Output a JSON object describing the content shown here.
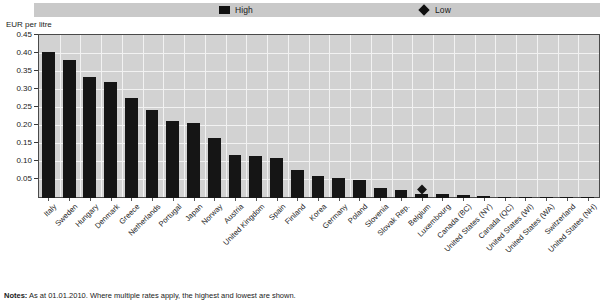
{
  "legend": {
    "high_label": "High",
    "low_label": "Low",
    "high_icon": "filled-square-marker",
    "low_icon": "filled-diamond-marker",
    "background_color": "#c9c9c9"
  },
  "axis_title": "EUR per litre",
  "notes": {
    "prefix": "Notes:",
    "text": " As at 01.01.2010. Where multiple rates apply, the highest and lowest are shown."
  },
  "style": {
    "bar_color": "#151515",
    "plot_background": "#d2d2d2",
    "gridline_color": "#f2f2f2",
    "frame_color": "#4a4a4a"
  },
  "chart_data": {
    "type": "bar",
    "title": "",
    "xlabel": "",
    "ylabel": "EUR per litre",
    "ylim": [
      0,
      0.45
    ],
    "ytick_labels": [
      "0.45",
      "0.40",
      "0.35",
      "0.30",
      "0.25",
      "0.20",
      "0.15",
      "0.10",
      "0.05"
    ],
    "ytick_values": [
      0.45,
      0.4,
      0.35,
      0.3,
      0.25,
      0.2,
      0.15,
      0.1,
      0.05
    ],
    "grid": true,
    "legend_position": "top",
    "categories": [
      "Italy",
      "Sweden",
      "Hungary",
      "Denmark",
      "Greece",
      "Netherlands",
      "Portugal",
      "Japan",
      "Norway",
      "Austria",
      "United Kingdom",
      "Spain",
      "Finland",
      "Korea",
      "Germany",
      "Poland",
      "Slovenia",
      "Slovak Rep.",
      "Belgium",
      "Luxembourg",
      "Canada (BC)",
      "United States (NY)",
      "Canada (QC)",
      "United States (WI)",
      "United States (WA)",
      "Switzerland",
      "United States (NH)"
    ],
    "series": [
      {
        "name": "High",
        "values": [
          0.405,
          0.382,
          0.337,
          0.322,
          0.277,
          0.245,
          0.213,
          0.208,
          0.168,
          0.12,
          0.118,
          0.11,
          0.078,
          0.06,
          0.055,
          0.05,
          0.027,
          0.022,
          0.012,
          0.01,
          0.008,
          0.005,
          0.004,
          0.003,
          0.003,
          0.002,
          0.002
        ]
      },
      {
        "name": "Low",
        "marker_category": "Belgium",
        "marker_value": 0.018
      }
    ]
  }
}
